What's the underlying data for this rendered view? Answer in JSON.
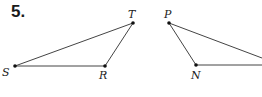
{
  "problem": {
    "number": "5."
  },
  "diagram": {
    "triangles": [
      {
        "name": "triangle-STR",
        "vertices": [
          {
            "label": "S",
            "x": 15,
            "y": 66
          },
          {
            "label": "T",
            "x": 133,
            "y": 23
          },
          {
            "label": "R",
            "x": 105,
            "y": 66
          }
        ]
      },
      {
        "name": "triangle-PN",
        "vertices": [
          {
            "label": "P",
            "x": 169,
            "y": 23
          },
          {
            "label": "N",
            "x": 196,
            "y": 65
          }
        ]
      }
    ],
    "labels": {
      "S": "S",
      "T": "T",
      "R": "R",
      "P": "P",
      "N": "N"
    }
  }
}
